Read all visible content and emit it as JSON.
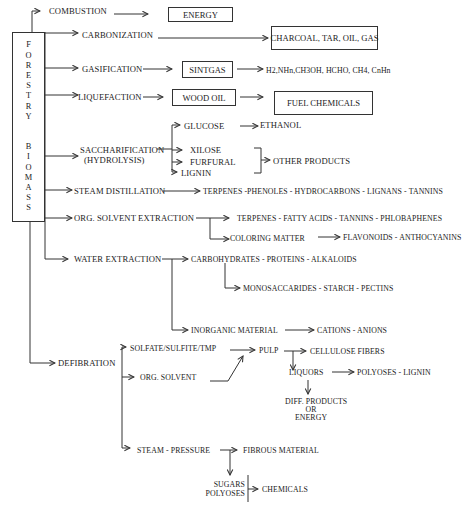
{
  "source": {
    "title_letters": [
      "F",
      "O",
      "R",
      "E",
      "S",
      "T",
      "R",
      "Y",
      "",
      "",
      "B",
      "I",
      "O",
      "M",
      "A",
      "S",
      "S"
    ],
    "label": "FORESTRY BIOMASS"
  },
  "processes": {
    "combustion": "COMBUSTION",
    "carbonization": "CARBONIZATION",
    "gasification": "GASIFICATION",
    "liquefaction": "LIQUEFACTION",
    "saccharification": "SACCHARIFICATION",
    "saccharification_sub": "(HYDROLYSIS)",
    "steam_distillation": "STEAM DISTILLATION",
    "org_solvent_extraction": "ORG. SOLVENT EXTRACTION",
    "water_extraction": "WATER EXTRACTION",
    "defibration": "DEFIBRATION"
  },
  "products": {
    "energy": "ENERGY",
    "charcoal": "CHARCOAL, TAR, OIL, GAS",
    "sintgas": "SINTGAS",
    "gases": "H2,NHn,CH3OH, HCHO, CH4, CnHn",
    "wood_oil": "WOOD OIL",
    "fuel_chemicals": "FUEL CHEMICALS",
    "glucose": "GLUCOSE",
    "ethanol": "ETHANOL",
    "xilose": "XILOSE",
    "furfural": "FURFURAL",
    "lignin": "LIGNIN",
    "other_products": "OTHER PRODUCTS",
    "steam_products": "TERPENES -PHENOLES - HYDROCARBONS - LIGNANS - TANNINS",
    "solvent_products": "TERPENES - FATTY ACIDS - TANNINS - PHLOBAPHENES",
    "coloring_matter": "COLORING MATTER",
    "flavonoids": "FLAVONOIDS - ANTHOCYANINS",
    "carbohydrates": "CARBOHYDRATES - PROTEINS - ALKALOIDS",
    "monosaccarides": "MONOSACCARIDES - STARCH - PECTINS",
    "inorganic": "INORGANIC MATERIAL",
    "cations": "CATIONS - ANIONS"
  },
  "defibration": {
    "solfate": "SOLFATE/SULFITE/TMP",
    "org_solvent": "ORG. SOLVENT",
    "pulp": "PULP",
    "cellulose": "CELLULOSE FIBERS",
    "liquors": "LIQUORS",
    "polyoses_lignin": "POLYOSES - LIGNIN",
    "diff_products": "DIFF. PRODUCTS",
    "or": "OR",
    "energy": "ENERGY",
    "steam_pressure": "STEAM - PRESSURE",
    "fibrous": "FIBROUS MATERIAL",
    "sugars": "SUGARS",
    "polyoses": "POLYOSES",
    "chemicals": "CHEMICALS"
  },
  "colors": {
    "line": "#333333",
    "text": "#222222",
    "background": "#ffffff"
  }
}
